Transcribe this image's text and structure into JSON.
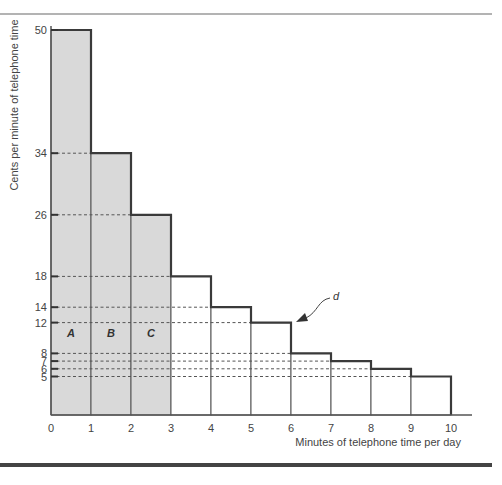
{
  "chart_data": {
    "type": "bar",
    "subtype": "step-histogram",
    "title": "",
    "xlabel": "Minutes of telephone time per day",
    "ylabel": "Cents per minute of telephone time",
    "x_ticks": [
      "0",
      "1",
      "2",
      "3",
      "4",
      "5",
      "6",
      "7",
      "8",
      "9",
      "10"
    ],
    "y_ticks": [
      "50",
      "34",
      "26",
      "18",
      "14",
      "12",
      "8",
      "7",
      "6",
      "5"
    ],
    "xlim": [
      0,
      10
    ],
    "ylim": [
      0,
      50
    ],
    "categories": [
      "0-1",
      "1-2",
      "2-3",
      "3-4",
      "4-5",
      "5-6",
      "6-7",
      "7-8",
      "8-9",
      "9-10"
    ],
    "values": [
      50,
      34,
      26,
      18,
      14,
      12,
      8,
      7,
      6,
      5
    ],
    "shaded_bars": [
      0,
      1,
      2
    ],
    "region_labels": [
      {
        "text": "A",
        "x": 0.5
      },
      {
        "text": "B",
        "x": 1.5
      },
      {
        "text": "C",
        "x": 2.5
      }
    ],
    "annotation": {
      "text": "d",
      "points_to": "step at minute 6, height 12"
    },
    "grid": false,
    "dashed_reference_lines": true,
    "colors": {
      "shaded_fill": "#d9d9d9",
      "outline": "#3a3a3a",
      "dashed": "#555555"
    }
  }
}
